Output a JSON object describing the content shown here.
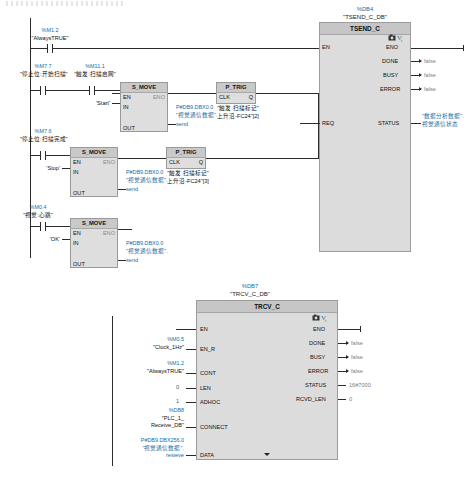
{
  "app": {
    "editor": "LAD ladder logic editor",
    "noise_strip": ""
  },
  "network1": {
    "rungs": [
      {
        "contacts": [
          {
            "addr": "%M1.2",
            "name": "\"AlwaysTRUE\"",
            "type": "NO"
          }
        ]
      },
      {
        "contacts": [
          {
            "addr": "%M7.7",
            "name": "\"停止位:开始扫描\"",
            "type": "NO"
          },
          {
            "addr": "%M11.1",
            "name": "\"触发:扫描启网\"",
            "type": "NO"
          }
        ],
        "move": {
          "title": "S_MOVE",
          "pin_en": "EN",
          "pin_eno": "ENO",
          "pin_in": "IN",
          "pin_out": "OUT",
          "in_value": "'Start'",
          "out_addr": "P#DB9.DBX0.0",
          "out_tag": "\"视觉通信数据\".",
          "out_member": "send"
        },
        "trig": {
          "title": "P_TRIG",
          "pin_clk": "CLK",
          "pin_q": "Q",
          "label_line1": "\"触发:扫描标记\"",
          "label_line2": "上升沿-FC24\"[2]"
        }
      },
      {
        "contacts": [
          {
            "addr": "%M7.6",
            "name": "\"停止位:扫描完成\"",
            "type": "NO"
          }
        ],
        "move": {
          "title": "S_MOVE",
          "pin_en": "EN",
          "pin_eno": "ENO",
          "pin_in": "IN",
          "pin_out": "OUT",
          "in_value": "'Stop'",
          "out_addr": "P#DB9.DBX0.0",
          "out_tag": "\"视觉通信数据\".",
          "out_member": "send"
        },
        "trig": {
          "title": "P_TRIG",
          "pin_clk": "CLK",
          "pin_q": "Q",
          "label_line1": "\"触发:扫描标记\"",
          "label_line2": "上升沿-FC24\"[3]"
        }
      },
      {
        "contacts": [
          {
            "addr": "%M0.4",
            "name": "\"视觉:心跳\"",
            "type": "NO"
          }
        ],
        "move": {
          "title": "S_MOVE",
          "pin_en": "EN",
          "pin_eno": "ENO",
          "pin_in": "IN",
          "pin_out": "OUT",
          "in_value": "'OK'",
          "out_addr": "P#DB9.DBX0.0",
          "out_tag": "\"视觉通信数据\".",
          "out_member": "send"
        }
      }
    ],
    "tsend": {
      "db_number": "%DB4",
      "db_name": "\"TSEND_C_DB\"",
      "title": "TSEND_C",
      "inputs": [
        {
          "pin": "EN",
          "value": ""
        },
        {
          "pin": "REQ",
          "value": ""
        }
      ],
      "outputs": [
        {
          "pin": "ENO",
          "value": ""
        },
        {
          "pin": "DONE",
          "value": "false"
        },
        {
          "pin": "BUSY",
          "value": "false"
        },
        {
          "pin": "ERROR",
          "value": "false"
        },
        {
          "pin": "STATUS",
          "value": ""
        }
      ],
      "status_tag_line1": "\"数据分析数据\".",
      "status_tag_line2": "视觉通信状态",
      "icon_1": "camera-icon",
      "icon_2": "variable-icon"
    }
  },
  "network2": {
    "trcv": {
      "db_number": "%DB7",
      "db_name": "\"TRCV_C_DB\"",
      "title": "TRCV_C",
      "icon_1": "camera-icon",
      "icon_2": "variable-icon",
      "inputs": [
        {
          "pin": "EN",
          "addr": "",
          "tag": "",
          "value": ""
        },
        {
          "pin": "EN_R",
          "addr": "%M0.5",
          "tag": "\"Clock_1Hz\"",
          "value": ""
        },
        {
          "pin": "CONT",
          "addr": "%M1.2",
          "tag": "\"AlwaysTRUE\"",
          "value": ""
        },
        {
          "pin": "LEN",
          "addr": "",
          "tag": "",
          "value": "0"
        },
        {
          "pin": "ADHOC",
          "addr": "",
          "tag": "",
          "value": "1"
        },
        {
          "pin": "CONNECT",
          "addr": "%DB8",
          "tag": "\"PLC_1_",
          "tag2": "Receive_DB\"",
          "value": ""
        },
        {
          "pin": "DATA",
          "addr": "P#DB9.DBX256.0",
          "tag": "\"视觉通信数据\".",
          "tag2": "resieve",
          "value": ""
        }
      ],
      "outputs": [
        {
          "pin": "ENO",
          "value": ""
        },
        {
          "pin": "DONE",
          "value": "false"
        },
        {
          "pin": "BUSY",
          "value": "false"
        },
        {
          "pin": "ERROR",
          "value": "false"
        },
        {
          "pin": "STATUS",
          "value": "16#7000"
        },
        {
          "pin": "RCVD_LEN",
          "value": "0"
        }
      ],
      "expand_chevron": "chevron-down-icon"
    }
  },
  "colors": {
    "tag_blue": "#0f6fa8",
    "block_fill": "#dcdcdc",
    "block_header": "#c6c6c6",
    "wire": "#2b2b2b",
    "value_gray": "#7d7d7d"
  }
}
